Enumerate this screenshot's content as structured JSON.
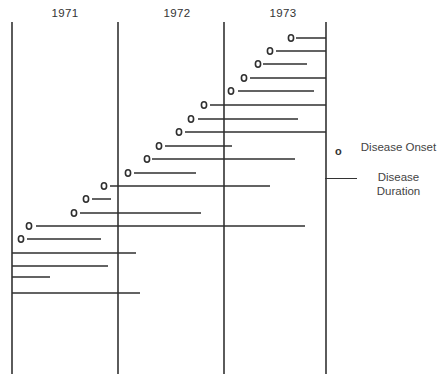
{
  "chart_data": {
    "type": "timeline",
    "title": "",
    "xlabel": "",
    "ylabel": "",
    "x_axis": {
      "unit": "year",
      "tick_labels": [
        "1971",
        "1972",
        "1973"
      ],
      "range": [
        "1971-01",
        "1973-12"
      ],
      "year_boundaries_px": [
        12,
        118,
        224,
        326
      ]
    },
    "legend": {
      "position": "right",
      "entries": [
        {
          "symbol": "o",
          "label": "Disease Onset"
        },
        {
          "symbol": "line",
          "label": "Disease Duration"
        }
      ]
    },
    "series": [
      {
        "name": "Patient 1",
        "onset": 1973.66,
        "duration_end": 1973.99,
        "onset_marked": true
      },
      {
        "name": "Patient 2",
        "onset": 1973.45,
        "duration_end": 1973.99,
        "onset_marked": true
      },
      {
        "name": "Patient 3",
        "onset": 1973.34,
        "duration_end": 1973.78,
        "onset_marked": true
      },
      {
        "name": "Patient 4",
        "onset": 1973.19,
        "duration_end": 1973.99,
        "onset_marked": true
      },
      {
        "name": "Patient 5",
        "onset": 1973.07,
        "duration_end": 1973.87,
        "onset_marked": true
      },
      {
        "name": "Patient 6",
        "onset": 1972.8,
        "duration_end": 1973.99,
        "onset_marked": true
      },
      {
        "name": "Patient 7",
        "onset": 1972.68,
        "duration_end": 1973.7,
        "onset_marked": true
      },
      {
        "name": "Patient 8",
        "onset": 1972.56,
        "duration_end": 1973.99,
        "onset_marked": true
      },
      {
        "name": "Patient 9",
        "onset": 1972.37,
        "duration_end": 1973.08,
        "onset_marked": true
      },
      {
        "name": "Patient 10",
        "onset": 1972.25,
        "duration_end": 1973.69,
        "onset_marked": true
      },
      {
        "name": "Patient 11",
        "onset": 1972.08,
        "duration_end": 1972.73,
        "onset_marked": true
      },
      {
        "name": "Patient 12",
        "onset": 1971.87,
        "duration_end": 1973.45,
        "onset_marked": true
      },
      {
        "name": "Patient 13",
        "onset": 1971.7,
        "duration_end": 1971.93,
        "onset_marked": true
      },
      {
        "name": "Patient 14",
        "onset": 1971.58,
        "duration_end": 1972.78,
        "onset_marked": true
      },
      {
        "name": "Patient 15",
        "onset": 1971.18,
        "duration_end": 1973.88,
        "onset_marked": true
      },
      {
        "name": "Patient 16",
        "onset": 1971.1,
        "duration_end": 1971.84,
        "onset_marked": true
      },
      {
        "name": "Patient 17",
        "onset": null,
        "duration_start": 1971.0,
        "duration_end": 1972.17,
        "onset_marked": false
      },
      {
        "name": "Patient 18",
        "onset": null,
        "duration_start": 1971.0,
        "duration_end": 1971.9,
        "onset_marked": false
      },
      {
        "name": "Patient 19",
        "onset": null,
        "duration_start": 1971.0,
        "duration_end": 1971.36,
        "onset_marked": false
      },
      {
        "name": "Patient 20",
        "onset": null,
        "duration_start": 1971.0,
        "duration_end": 1972.2,
        "onset_marked": false
      }
    ],
    "rows_px": [
      {
        "y": 38,
        "onset_x": 291,
        "x1": 296,
        "x2": 326
      },
      {
        "y": 51,
        "onset_x": 270,
        "x1": 276,
        "x2": 326
      },
      {
        "y": 64,
        "onset_x": 258,
        "x1": 263,
        "x2": 307
      },
      {
        "y": 78,
        "onset_x": 244,
        "x1": 250,
        "x2": 326
      },
      {
        "y": 91,
        "onset_x": 231,
        "x1": 238,
        "x2": 314
      },
      {
        "y": 105,
        "onset_x": 204,
        "x1": 210,
        "x2": 326
      },
      {
        "y": 119,
        "onset_x": 191,
        "x1": 198,
        "x2": 298
      },
      {
        "y": 132,
        "onset_x": 179,
        "x1": 185,
        "x2": 326
      },
      {
        "y": 146,
        "onset_x": 159,
        "x1": 165,
        "x2": 232
      },
      {
        "y": 159,
        "onset_x": 147,
        "x1": 152,
        "x2": 295
      },
      {
        "y": 173,
        "onset_x": 128,
        "x1": 134,
        "x2": 196
      },
      {
        "y": 186,
        "onset_x": 104,
        "x1": 110,
        "x2": 270
      },
      {
        "y": 199,
        "onset_x": 86,
        "x1": 92,
        "x2": 111
      },
      {
        "y": 213,
        "onset_x": 74,
        "x1": 80,
        "x2": 201
      },
      {
        "y": 226,
        "onset_x": 29,
        "x1": 36,
        "x2": 305
      },
      {
        "y": 239,
        "onset_x": 21,
        "x1": 27,
        "x2": 101
      },
      {
        "y": 253,
        "onset_x": null,
        "x1": 12,
        "x2": 136
      },
      {
        "y": 266,
        "onset_x": null,
        "x1": 12,
        "x2": 108
      },
      {
        "y": 277,
        "onset_x": null,
        "x1": 12,
        "x2": 50
      },
      {
        "y": 293,
        "onset_x": null,
        "x1": 12,
        "x2": 140
      }
    ]
  },
  "axis": {
    "year_1": "1971",
    "year_2": "1972",
    "year_3": "1973"
  },
  "legend": {
    "onset_symbol": "o",
    "onset_label": "Disease Onset",
    "duration_label": "Disease Duration"
  },
  "colors": {
    "ink": "#2f2f2f",
    "background": "#ffffff"
  }
}
